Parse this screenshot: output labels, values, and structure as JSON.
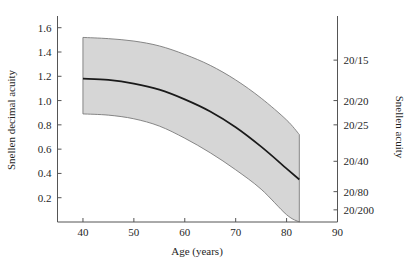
{
  "chart_data": {
    "type": "line",
    "title": "",
    "xlabel": "Age (years)",
    "ylabel": "Snellen decimal acuity",
    "ylabel_right": "Snellen acuity",
    "xlim": [
      35,
      90
    ],
    "ylim": [
      0.0,
      1.68
    ],
    "grid": false,
    "legend": "none",
    "x_ticks": [
      40,
      50,
      60,
      70,
      80,
      90
    ],
    "x_tick_labels": [
      "40",
      "50",
      "60",
      "70",
      "80",
      "90"
    ],
    "y_ticks": [
      0.2,
      0.4,
      0.6,
      0.8,
      1.0,
      1.2,
      1.4,
      1.6
    ],
    "y_tick_labels": [
      "0.2",
      "0.4",
      "0.6",
      "0.8",
      "1.0",
      "1.2",
      "1.4",
      "1.6"
    ],
    "y_ticks_right_values": [
      1.333,
      1.0,
      0.8,
      0.5,
      0.25,
      0.1
    ],
    "y_tick_labels_right": [
      "20/15",
      "20/20",
      "20/25",
      "20/40",
      "20/80",
      "20/200"
    ],
    "x": [
      40,
      45,
      50,
      55,
      60,
      65,
      70,
      75,
      80,
      82.5
    ],
    "series": [
      {
        "name": "mean",
        "values": [
          1.18,
          1.17,
          1.14,
          1.09,
          1.01,
          0.91,
          0.78,
          0.62,
          0.44,
          0.35
        ]
      },
      {
        "name": "upper",
        "values": [
          1.52,
          1.51,
          1.49,
          1.45,
          1.38,
          1.29,
          1.17,
          1.02,
          0.84,
          0.72
        ]
      },
      {
        "name": "lower",
        "values": [
          0.89,
          0.88,
          0.85,
          0.79,
          0.69,
          0.57,
          0.43,
          0.27,
          0.06,
          0.0
        ]
      }
    ],
    "band_fill_color": "#d6d6d6",
    "band_edge_color": "#7a7a7a",
    "line_color": "#1a1a1a",
    "axis_color": "#555555",
    "band_right_cut_age": 82.5
  },
  "axes": {
    "x_title": "Age (years)",
    "y_left_title": "Snellen decimal acuity",
    "y_right_title": "Snellen acuity"
  }
}
